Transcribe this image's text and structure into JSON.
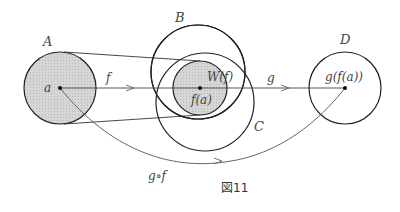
{
  "figure": {
    "caption": "図11",
    "sets": {
      "A": "A",
      "B": "B",
      "C": "C",
      "D": "D"
    },
    "points": {
      "a": "a",
      "f_a": "f(a)",
      "g_f_a": "g(f(a))"
    },
    "image_label": "W(f)",
    "maps": {
      "f": "f",
      "g": "g",
      "composite": "g∘f"
    },
    "colors": {
      "stroke": "#222222",
      "shade": "#cfcfcf",
      "text": "#444444"
    }
  }
}
